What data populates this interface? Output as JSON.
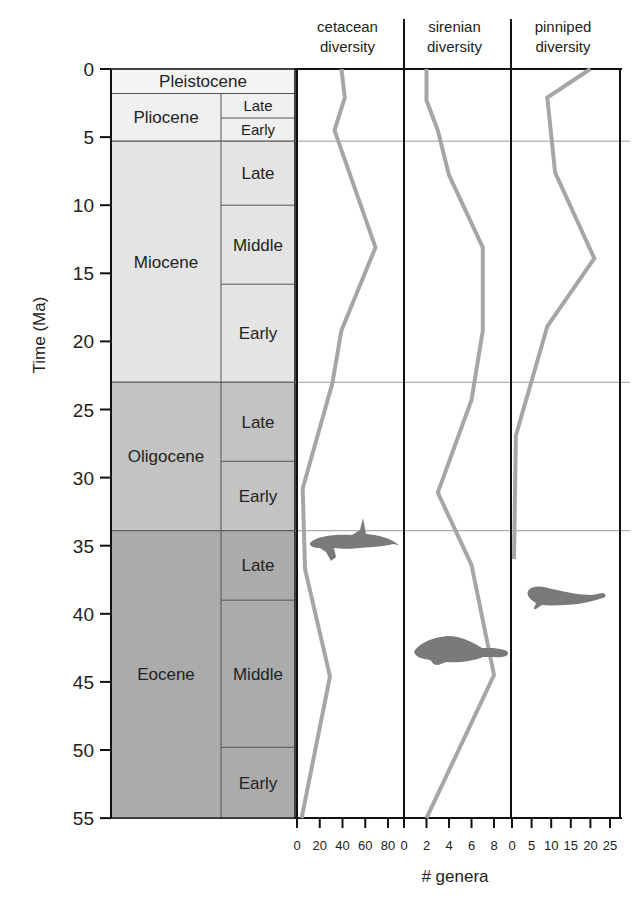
{
  "figure": {
    "y_axis_label": "Time (Ma)",
    "x_axis_label": "# genera",
    "column_headers": [
      {
        "line1": "cetacean",
        "line2": "diversity"
      },
      {
        "line1": "sirenian",
        "line2": "diversity"
      },
      {
        "line1": "pinniped",
        "line2": "diversity"
      }
    ],
    "epochs": [
      {
        "name": "Pleistocene",
        "start": 0,
        "end": 1.8,
        "color": "#f4f4f4",
        "subdivisions": []
      },
      {
        "name": "Pliocene",
        "start": 1.8,
        "end": 5.3,
        "color": "#f0f0f0",
        "subdivisions": [
          {
            "name": "Late",
            "start": 1.8,
            "end": 3.6
          },
          {
            "name": "Early",
            "start": 3.6,
            "end": 5.3
          }
        ]
      },
      {
        "name": "Miocene",
        "start": 5.3,
        "end": 23.0,
        "color": "#e4e4e4",
        "subdivisions": [
          {
            "name": "Late",
            "start": 5.3,
            "end": 10
          },
          {
            "name": "Middle",
            "start": 10,
            "end": 15.8
          },
          {
            "name": "Early",
            "start": 15.8,
            "end": 23.0
          }
        ]
      },
      {
        "name": "Oligocene",
        "start": 23.0,
        "end": 33.9,
        "color": "#c3c3c3",
        "subdivisions": [
          {
            "name": "Late",
            "start": 23.0,
            "end": 28.8
          },
          {
            "name": "Early",
            "start": 28.8,
            "end": 33.9
          }
        ]
      },
      {
        "name": "Eocene",
        "start": 33.9,
        "end": 55.0,
        "color": "#ababab",
        "subdivisions": [
          {
            "name": "Late",
            "start": 33.9,
            "end": 39.0
          },
          {
            "name": "Middle",
            "start": 39.0,
            "end": 49.8
          },
          {
            "name": "Early",
            "start": 49.8,
            "end": 55.0
          }
        ]
      }
    ],
    "silhouettes": [
      "whale-silhouette",
      "manatee-silhouette",
      "seal-silhouette"
    ]
  },
  "chart_data": {
    "type": "line",
    "title": "",
    "ylabel": "Time (Ma)",
    "xlabel": "# genera",
    "ylim": [
      55,
      0
    ],
    "y_ticks": [
      0,
      5,
      10,
      15,
      20,
      25,
      30,
      35,
      40,
      45,
      50,
      55
    ],
    "grid": "horizontal lines at epoch boundaries (5.3, 23.0, 33.9 Ma)",
    "legend": "none (panel headers)",
    "series": [
      {
        "name": "cetacean diversity",
        "xlim": [
          0,
          80
        ],
        "x_ticks": [
          0,
          20,
          40,
          60,
          80
        ],
        "points": [
          [
            0,
            39
          ],
          [
            2.1,
            42
          ],
          [
            4.5,
            33
          ],
          [
            13.1,
            69
          ],
          [
            19.2,
            39
          ],
          [
            23.1,
            31
          ],
          [
            30.8,
            5
          ],
          [
            36.7,
            7
          ],
          [
            44.6,
            29
          ],
          [
            55,
            4
          ]
        ]
      },
      {
        "name": "sirenian diversity",
        "xlim": [
          0,
          8
        ],
        "x_ticks": [
          0,
          2,
          4,
          6,
          8
        ],
        "points": [
          [
            0,
            2
          ],
          [
            2.3,
            2
          ],
          [
            4.5,
            3
          ],
          [
            7.8,
            4
          ],
          [
            13.1,
            7
          ],
          [
            19.2,
            7
          ],
          [
            24.3,
            6
          ],
          [
            31.1,
            3
          ],
          [
            36.4,
            6
          ],
          [
            44.5,
            8
          ],
          [
            55,
            2
          ]
        ]
      },
      {
        "name": "pinniped diversity",
        "xlim": [
          0,
          25
        ],
        "x_ticks": [
          0,
          5,
          10,
          15,
          20,
          25
        ],
        "points": [
          [
            0,
            20
          ],
          [
            2.1,
            9
          ],
          [
            7.6,
            11
          ],
          [
            13.9,
            21
          ],
          [
            18.9,
            9
          ],
          [
            26.9,
            1
          ],
          [
            36.0,
            0.5
          ]
        ]
      }
    ],
    "point_format": "[time_Ma, genera]"
  },
  "colors": {
    "curve": "#a6a6a6",
    "silhouette": "#7a7a7a",
    "axis": "#111111",
    "grid": "#9a9a9a"
  }
}
